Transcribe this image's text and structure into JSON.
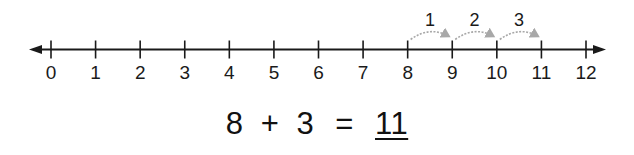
{
  "number_line": {
    "min": 0,
    "max": 12,
    "tick_labels": [
      "0",
      "1",
      "2",
      "3",
      "4",
      "5",
      "6",
      "7",
      "8",
      "9",
      "10",
      "11",
      "12"
    ],
    "arrows": "both-ends",
    "start_point": 8,
    "jumps": [
      {
        "from": 8,
        "to": 9,
        "label": "1"
      },
      {
        "from": 9,
        "to": 10,
        "label": "2"
      },
      {
        "from": 10,
        "to": 11,
        "label": "3"
      }
    ],
    "jump_color": "#a8a8a8",
    "line_color": "#1a1a1a"
  },
  "equation": {
    "addend1": "8",
    "plus": "+",
    "addend2": "3",
    "equals": "=",
    "answer": "11"
  }
}
